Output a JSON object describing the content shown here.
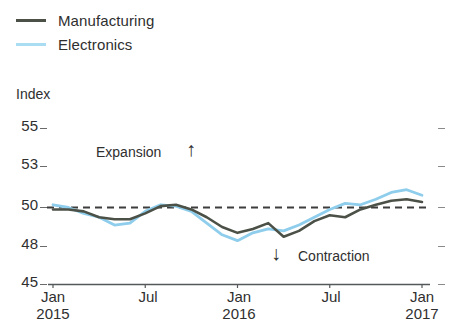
{
  "legend": {
    "items": [
      {
        "label": "Manufacturing",
        "color": "#4c5148",
        "icon": "line-swatch-icon"
      },
      {
        "label": "Electronics",
        "color": "#aadcf2",
        "icon": "line-swatch-icon"
      }
    ]
  },
  "annotations": {
    "expansion": {
      "text": "Expansion",
      "arrow": "↑"
    },
    "contraction": {
      "text": "Contraction",
      "arrow": "↓"
    }
  },
  "chart_data": {
    "type": "line",
    "title": "",
    "subtitle": "",
    "xlabel": "",
    "ylabel": "Index",
    "ylim": [
      45,
      55
    ],
    "ytick_labels": [
      "55",
      "53",
      "50",
      "48",
      "45"
    ],
    "ytick_values": [
      55,
      53,
      50,
      48,
      45
    ],
    "xtick_labels": [
      "Jan",
      "Jul",
      "Jan",
      "Jul",
      "Jan"
    ],
    "xtick_sublabels": [
      "2015",
      "",
      "2016",
      "",
      "2017"
    ],
    "xlim": [
      "Jan 2015",
      "Jan 2017"
    ],
    "grid": false,
    "legend_position": "top-left",
    "reference_line": {
      "value": 50,
      "style": "dashed",
      "color": "#3d3d3d"
    },
    "x": [
      "Jan 2015",
      "Feb 2015",
      "Mar 2015",
      "Apr 2015",
      "May 2015",
      "Jun 2015",
      "Jul 2015",
      "Aug 2015",
      "Sep 2015",
      "Oct 2015",
      "Nov 2015",
      "Dec 2015",
      "Jan 2016",
      "Feb 2016",
      "Mar 2016",
      "Apr 2016",
      "May 2016",
      "Jun 2016",
      "Jul 2016",
      "Aug 2016",
      "Sep 2016",
      "Oct 2016",
      "Nov 2016",
      "Dec 2016",
      "Jan 2017"
    ],
    "series": [
      {
        "name": "Manufacturing",
        "color": "#4c5148",
        "values": [
          49.9,
          49.9,
          49.8,
          49.5,
          49.4,
          49.4,
          49.7,
          50.1,
          50.2,
          49.9,
          49.5,
          49.0,
          48.7,
          48.9,
          49.2,
          48.5,
          48.8,
          49.3,
          49.6,
          49.5,
          49.9,
          50.2,
          50.5,
          50.6,
          50.4
        ]
      },
      {
        "name": "Electronics",
        "color": "#8ecdeb",
        "values": [
          50.2,
          50.0,
          49.7,
          49.5,
          49.1,
          49.2,
          49.8,
          50.2,
          50.1,
          49.8,
          49.2,
          48.6,
          48.3,
          48.7,
          48.9,
          48.8,
          49.1,
          49.5,
          49.9,
          50.3,
          50.2,
          50.6,
          51.1,
          51.3,
          50.9
        ]
      }
    ]
  }
}
